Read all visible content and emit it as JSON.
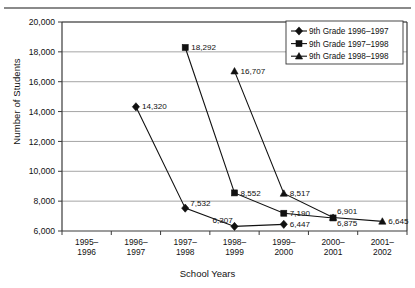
{
  "chart_data": {
    "type": "line",
    "title": "",
    "xlabel": "School Years",
    "ylabel": "Number of Students",
    "categories": [
      "1995–1996",
      "1996–1997",
      "1997–1998",
      "1998–1999",
      "1999–2000",
      "2000–2001",
      "2001–2002"
    ],
    "ylim": [
      6000,
      20000
    ],
    "ytick_labels": [
      "20,000",
      "18,000",
      "16,000",
      "14,000",
      "12,000",
      "10,000",
      "8,000",
      "6,000"
    ],
    "ytick_values": [
      20000,
      18000,
      16000,
      14000,
      12000,
      10000,
      8000,
      6000
    ],
    "grid": "horizontal",
    "legend_position": "top-right",
    "series": [
      {
        "name": "9th Grade 1996–1997",
        "marker": "diamond",
        "points": [
          {
            "x": "1996–1997",
            "y": 14320,
            "label": "14,320"
          },
          {
            "x": "1997–1998",
            "y": 7532,
            "label": "7,532"
          },
          {
            "x": "1998–1999",
            "y": 6307,
            "label": "6,307"
          },
          {
            "x": "1999–2000",
            "y": 6447,
            "label": "6,447"
          }
        ]
      },
      {
        "name": "9th Grade 1997–1998",
        "marker": "square",
        "points": [
          {
            "x": "1997–1998",
            "y": 18292,
            "label": "18,292"
          },
          {
            "x": "1998–1999",
            "y": 8552,
            "label": "8,552"
          },
          {
            "x": "1999–2000",
            "y": 7190,
            "label": "7,190"
          },
          {
            "x": "2000–2001",
            "y": 6875,
            "label": "6,875"
          }
        ]
      },
      {
        "name": "9th Grade 1998–1998",
        "marker": "triangle",
        "points": [
          {
            "x": "1998–1999",
            "y": 16707,
            "label": "16,707"
          },
          {
            "x": "1999–2000",
            "y": 8517,
            "label": "8,517"
          },
          {
            "x": "2000–2001",
            "y": 6901,
            "label": "6,901"
          },
          {
            "x": "2001–2002",
            "y": 6645,
            "label": "6,645"
          }
        ]
      }
    ]
  },
  "axes": {
    "y_title": "Number of Students",
    "x_title": "School Years"
  },
  "colors": {
    "ink": "#111111",
    "grid": "#9b9b9b",
    "background": "#ffffff"
  }
}
